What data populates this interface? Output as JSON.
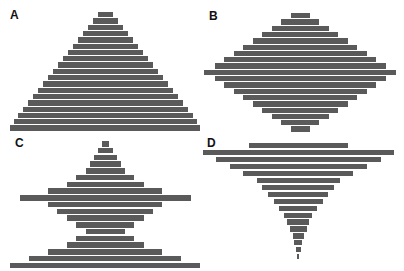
{
  "colors": {
    "bar": "#5a5a5a",
    "background": "#ffffff",
    "label": "#111111"
  },
  "panels": [
    {
      "label": "A",
      "label_x": 10,
      "label_y": 8,
      "center_x": 105,
      "top_y": 12,
      "step": 6.3,
      "bar_height": 5.4
    },
    {
      "label": "B",
      "label_x": 209,
      "label_y": 9,
      "center_x": 300,
      "top_y": 13,
      "step": 6.3,
      "bar_height": 5.4
    },
    {
      "label": "C",
      "label_x": 15,
      "label_y": 136,
      "center_x": 105,
      "top_y": 141,
      "step": 6.75,
      "bar_height": 5.7
    },
    {
      "label": "D",
      "label_x": 207,
      "label_y": 136,
      "center_x": 298,
      "top_y": 143,
      "step": 6.95,
      "bar_height": 5.2
    }
  ],
  "chart_data": [
    {
      "type": "bar",
      "orientation": "horizontal-centered",
      "title": "A",
      "shape": "triangle",
      "values": [
        15,
        25,
        35,
        45,
        55,
        65,
        75,
        85,
        95,
        105,
        115,
        125,
        135,
        145,
        155,
        165,
        175,
        183,
        190
      ],
      "xlabel": "",
      "ylabel": "",
      "grid": false
    },
    {
      "type": "bar",
      "orientation": "horizontal-centered",
      "title": "B",
      "shape": "diamond",
      "values": [
        19,
        38,
        57,
        76,
        95,
        114,
        133,
        152,
        171,
        192,
        171,
        152,
        133,
        114,
        95,
        76,
        57,
        38,
        19
      ],
      "xlabel": "",
      "ylabel": "",
      "grid": false
    },
    {
      "type": "bar",
      "orientation": "horizontal-centered",
      "title": "C",
      "shape": "spiked hourglass",
      "values": [
        7,
        15,
        23,
        31,
        39,
        58,
        77,
        114,
        171,
        114,
        96,
        77,
        58,
        39,
        58,
        77,
        114,
        152,
        190
      ],
      "xlabel": "",
      "ylabel": "",
      "grid": false
    },
    {
      "type": "bar",
      "orientation": "horizontal-centered",
      "title": "D",
      "shape": "inverted triangle",
      "values": [
        99,
        191,
        165,
        137,
        110,
        83,
        72,
        60,
        49,
        38,
        28,
        22,
        17,
        11,
        8,
        5,
        2
      ],
      "xlabel": "",
      "ylabel": "",
      "grid": false
    }
  ]
}
